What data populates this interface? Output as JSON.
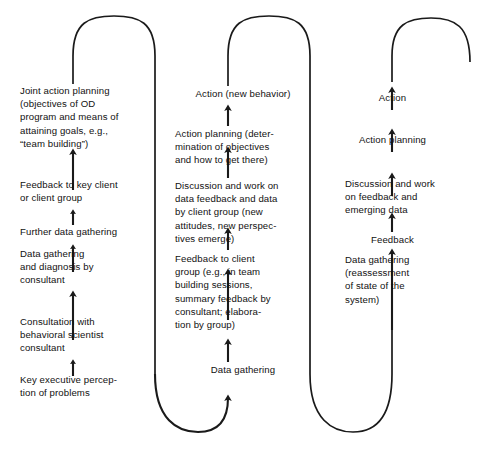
{
  "diagram": {
    "type": "serpentine-flow",
    "line_color": "#1a1a1a",
    "text_color": "#111111",
    "background": "#ffffff",
    "columns": [
      {
        "id": "column-1",
        "name": "initial-entry-and-diagnosis",
        "direction": "upward",
        "steps": [
          {
            "id": "c1s1",
            "name": "key-executive-perception",
            "text": "Key executive percep-\ntion of problems"
          },
          {
            "id": "c1s2",
            "name": "consultation-with-behavioral-scientist",
            "text": "Consultation with\nbehavioral scientist\nconsultant"
          },
          {
            "id": "c1s3",
            "name": "data-gathering-and-diagnosis",
            "text": "Data gathering\nand diagnosis by\nconsultant"
          },
          {
            "id": "c1s4",
            "name": "further-data-gathering",
            "text": "Further data gathering"
          },
          {
            "id": "c1s5",
            "name": "feedback-to-key-client",
            "text": "Feedback to key client\nor client group"
          },
          {
            "id": "c1s6",
            "name": "joint-action-planning",
            "text": "Joint action planning\n(objectives of OD\nprogram and means of\nattaining goals, e.g.,\n“team building”)"
          }
        ]
      },
      {
        "id": "column-2",
        "name": "first-action-cycle",
        "direction": "upward",
        "steps": [
          {
            "id": "c2s1",
            "name": "data-gathering",
            "text": "Data gathering"
          },
          {
            "id": "c2s2",
            "name": "feedback-to-client-group",
            "text": "Feedback to client\ngroup (e.g., in team\nbuilding sessions,\nsummary feedback by\nconsultant; elabora-\ntion by group)"
          },
          {
            "id": "c2s3",
            "name": "discussion-and-work-on-data-feedback",
            "text": "Discussion and work on\ndata feedback and data\nby client group (new\nattitudes, new perspec-\ntives emerge)"
          },
          {
            "id": "c2s4",
            "name": "action-planning-determination",
            "text": "Action planning (deter-\nmination of objectives\nand how to get there)"
          },
          {
            "id": "c2s5",
            "name": "action-new-behavior",
            "text": "Action (new behavior)"
          }
        ]
      },
      {
        "id": "column-3",
        "name": "second-action-cycle",
        "direction": "upward",
        "steps": [
          {
            "id": "c3s1",
            "name": "data-gathering-reassessment",
            "text": "Data gathering\n(reassessment\nof  state of the\nsystem)"
          },
          {
            "id": "c3s2",
            "name": "feedback",
            "text": "Feedback"
          },
          {
            "id": "c3s3",
            "name": "discussion-and-work-on-feedback",
            "text": "Discussion and work\non feedback and\nemerging data"
          },
          {
            "id": "c3s4",
            "name": "action-planning",
            "text": "Action planning"
          },
          {
            "id": "c3s5",
            "name": "action",
            "text": "Action"
          }
        ]
      }
    ],
    "connectors": [
      {
        "id": "conn-1",
        "name": "top-arch-column1-to-descender1",
        "shape": "arch-over-top"
      },
      {
        "id": "conn-2",
        "name": "bottom-arc-descender1-to-column2",
        "shape": "u-turn-bottom"
      },
      {
        "id": "conn-3",
        "name": "top-arch-column2-to-descender2",
        "shape": "arch-over-top"
      },
      {
        "id": "conn-4",
        "name": "bottom-arc-descender2-to-column3",
        "shape": "u-turn-bottom"
      },
      {
        "id": "conn-5",
        "name": "top-arch-column3-open-end",
        "shape": "arch-over-top-open"
      }
    ]
  }
}
